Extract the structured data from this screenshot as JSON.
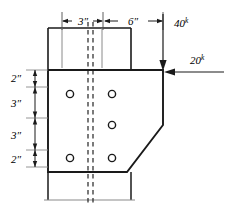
{
  "figure": {
    "units": "inches",
    "dimensions": {
      "horizontal": [
        {
          "id": "dim-3in-top",
          "label": "3″",
          "value": 3,
          "unit": "in",
          "from_px": 62,
          "to_px": 102
        },
        {
          "id": "dim-6in-top",
          "label": "6″",
          "value": 6,
          "unit": "in",
          "from_px": 104,
          "to_px": 163
        }
      ],
      "vertical": [
        {
          "id": "dim-2in-upper",
          "label": "2″",
          "value": 2,
          "unit": "in",
          "from_px": 70,
          "to_px": 87
        },
        {
          "id": "dim-3in-upper",
          "label": "3″",
          "value": 3,
          "unit": "in",
          "from_px": 87,
          "to_px": 118
        },
        {
          "id": "dim-3in-lower",
          "label": "3″",
          "value": 3,
          "unit": "in",
          "from_px": 118,
          "to_px": 150
        },
        {
          "id": "dim-2in-lower",
          "label": "2″",
          "value": 2,
          "unit": "in",
          "from_px": 150,
          "to_px": 167
        }
      ]
    },
    "loads": [
      {
        "id": "load-vertical",
        "magnitude": "40",
        "superscript": "k",
        "unit": "kips",
        "direction": "down",
        "applied_at_px": [
          163,
          70
        ]
      },
      {
        "id": "load-horizontal",
        "magnitude": "20",
        "superscript": "k",
        "unit": "kips",
        "direction": "left",
        "applied_at_px": [
          163,
          72
        ]
      }
    ],
    "bolt_holes": [
      {
        "id": "bolt-hole-left-top",
        "cx": 70,
        "cy": 94,
        "r": 3.6
      },
      {
        "id": "bolt-hole-right-top",
        "cx": 112,
        "cy": 94,
        "r": 3.6
      },
      {
        "id": "bolt-hole-right-mid",
        "cx": 112,
        "cy": 125,
        "r": 3.6
      },
      {
        "id": "bolt-hole-left-bottom",
        "cx": 70,
        "cy": 158,
        "r": 3.6
      },
      {
        "id": "bolt-hole-right-bottom",
        "cx": 112,
        "cy": 158,
        "r": 3.6
      }
    ],
    "colors": {
      "line": "#1a1a1a",
      "thin_line": "#6e6e6e",
      "background": "#ffffff"
    }
  }
}
